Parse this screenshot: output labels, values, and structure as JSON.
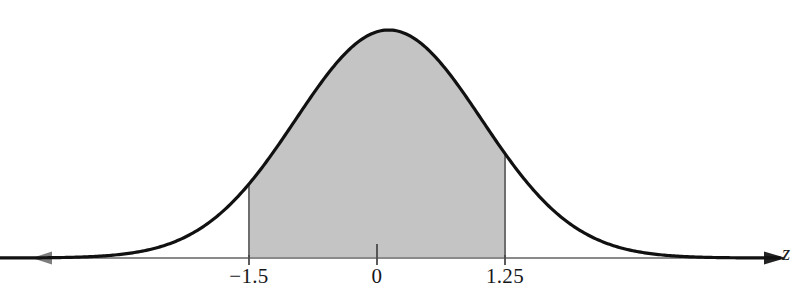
{
  "figure": {
    "name": "standard-normal-curve-with-shaded-area",
    "background_color": "#ffffff",
    "width": 806,
    "height": 307
  },
  "axis": {
    "variable_label": "z",
    "line_color": "#8a8a8a",
    "baseline_y": 258,
    "left_arrow_x": 32,
    "right_arrow_x": 770,
    "double_headed": "true"
  },
  "ticks": [
    {
      "label": "−1.5",
      "x": 249
    },
    {
      "label": "0",
      "x": 377
    },
    {
      "label": "1.25",
      "x": 505
    }
  ],
  "curve": {
    "stroke_color": "#111111",
    "stroke_width": 3.2,
    "peak_x": 383,
    "peak_y": 30
  },
  "shaded_region": {
    "fill_color": "#c4c4c4",
    "edge_color": "#6e6e6e",
    "lower_bound_label": "−1.5",
    "upper_bound_label": "1.25",
    "lower_bound_x": 249,
    "upper_bound_x": 505
  },
  "chart_data": {
    "type": "area",
    "title": "",
    "subtitle": "",
    "xlabel": "z",
    "ylabel": "",
    "distribution": "standard normal",
    "mean": 0,
    "standard_deviation": 1,
    "grid": "off",
    "legend": "none",
    "xlim": [
      -4.2,
      4.2
    ],
    "ylim": [
      0,
      0.42
    ],
    "shaded_interval": [
      -1.5,
      1.25
    ],
    "tick_labels": [
      "−1.5",
      "0",
      "1.25"
    ],
    "tick_values": [
      -1.5,
      0,
      1.25
    ],
    "annotations": [
      "z"
    ],
    "x": [
      -4.2,
      -4.0,
      -3.8,
      -3.6,
      -3.4,
      -3.2,
      -3.0,
      -2.8,
      -2.6,
      -2.4,
      -2.2,
      -2.0,
      -1.8,
      -1.6,
      -1.5,
      -1.4,
      -1.2,
      -1.0,
      -0.8,
      -0.6,
      -0.4,
      -0.2,
      0.0,
      0.2,
      0.4,
      0.6,
      0.8,
      1.0,
      1.2,
      1.25,
      1.4,
      1.6,
      1.8,
      2.0,
      2.2,
      2.4,
      2.6,
      2.8,
      3.0,
      3.2,
      3.4,
      3.6,
      3.8,
      4.0,
      4.2
    ],
    "y": [
      0.0001,
      0.0001,
      0.0003,
      0.0006,
      0.0012,
      0.0024,
      0.0044,
      0.0079,
      0.0136,
      0.0224,
      0.0355,
      0.054,
      0.079,
      0.1109,
      0.1295,
      0.1497,
      0.1942,
      0.242,
      0.2897,
      0.3332,
      0.3683,
      0.391,
      0.3989,
      0.391,
      0.3683,
      0.3332,
      0.2897,
      0.242,
      0.1942,
      0.1826,
      0.1497,
      0.1109,
      0.079,
      0.054,
      0.0355,
      0.0224,
      0.0136,
      0.0079,
      0.0044,
      0.0024,
      0.0012,
      0.0006,
      0.0003,
      0.0001,
      0.0001
    ]
  }
}
